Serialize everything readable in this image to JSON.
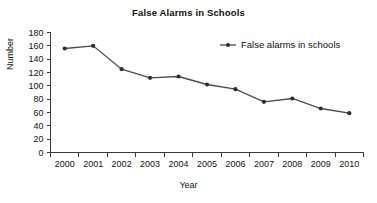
{
  "chart_data": {
    "type": "line",
    "title": "False Alarms in Schools",
    "xlabel": "Year",
    "ylabel": "Number",
    "categories": [
      "2000",
      "2001",
      "2002",
      "2003",
      "2004",
      "2005",
      "2006",
      "2007",
      "2008",
      "2009",
      "2010"
    ],
    "series": [
      {
        "name": "False alarms in schools",
        "values": [
          156,
          160,
          125,
          112,
          114,
          102,
          95,
          76,
          81,
          66,
          59
        ]
      }
    ],
    "ylim": [
      0,
      180
    ],
    "y_ticks": [
      0,
      20,
      40,
      60,
      80,
      100,
      120,
      140,
      160,
      180
    ],
    "grid": false,
    "legend_position": "top-right",
    "series_color": "#4a4a4a",
    "marker_color": "#2e2e2e",
    "axis_color": "#3a3a3a"
  },
  "legend": {
    "entries": [
      {
        "label": "False alarms in schools"
      }
    ]
  }
}
